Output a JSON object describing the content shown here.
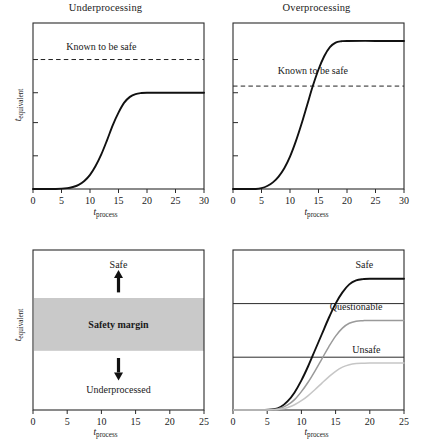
{
  "figure": {
    "axis_labels": {
      "x_var": "t",
      "x_sub": "process",
      "y_var": "t",
      "y_sub": "equivalent"
    }
  },
  "panels": [
    {
      "id": "underprocessing",
      "title": "Underprocessing",
      "x_ticks": [
        "0",
        "5",
        "10",
        "15",
        "20",
        "25",
        "30"
      ],
      "annotations": [
        {
          "name": "known-to-be-safe-label",
          "text": "Known to be safe"
        }
      ]
    },
    {
      "id": "overprocessing",
      "title": "Overprocessing",
      "x_ticks": [
        "0",
        "5",
        "10",
        "15",
        "20",
        "25",
        "30"
      ],
      "annotations": [
        {
          "name": "known-to-be-safe-label",
          "text": "Known to be safe"
        }
      ]
    },
    {
      "id": "safety-margin",
      "title": "",
      "x_ticks": [
        "0",
        "5",
        "10",
        "15",
        "20",
        "25"
      ],
      "annotations": [
        {
          "name": "safe-label",
          "text": "Safe"
        },
        {
          "name": "safety-margin-label",
          "text": "Safety margin"
        },
        {
          "name": "underprocessed-label",
          "text": "Underprocessed"
        }
      ]
    },
    {
      "id": "outcome-curves",
      "title": "",
      "x_ticks": [
        "0",
        "5",
        "10",
        "15",
        "20",
        "25"
      ],
      "annotations": [
        {
          "name": "safe-curve-label",
          "text": "Safe"
        },
        {
          "name": "questionable-curve-label",
          "text": "Questionable"
        },
        {
          "name": "unsafe-curve-label",
          "text": "Unsafe"
        }
      ]
    }
  ],
  "colors": {
    "axis": "#2b2b2b",
    "curve_safe": "#111111",
    "curve_questionable": "#9a9a9a",
    "curve_unsafe": "#c6c6c6",
    "safety_band": "#c9c9c9",
    "text": "#1a1a1a"
  },
  "chart_data": [
    {
      "type": "line",
      "id": "underprocessing",
      "title": "Underprocessing",
      "xlabel": "t_process",
      "ylabel": "t_equivalent",
      "xlim": [
        0,
        30
      ],
      "ylim": [
        0,
        1
      ],
      "xticks": [
        0,
        5,
        10,
        15,
        20,
        25,
        30
      ],
      "grid": false,
      "legend": "none",
      "series": [
        {
          "name": "equivalent time",
          "color": "#111111",
          "x": [
            0,
            2,
            4,
            6,
            7,
            8,
            9,
            10,
            11,
            12,
            13,
            14,
            15,
            16,
            17,
            18,
            19,
            20,
            22,
            25,
            30
          ],
          "y": [
            0.0,
            0.0,
            0.0,
            0.005,
            0.012,
            0.025,
            0.048,
            0.085,
            0.14,
            0.21,
            0.295,
            0.385,
            0.46,
            0.52,
            0.555,
            0.572,
            0.578,
            0.58,
            0.58,
            0.58,
            0.58
          ]
        }
      ],
      "reference_lines": [
        {
          "name": "Known to be safe",
          "type": "horizontal",
          "y": 0.78,
          "style": "dashed"
        }
      ],
      "annotations": [
        {
          "text": "Known to be safe",
          "x": 12,
          "y": 0.84
        }
      ]
    },
    {
      "type": "line",
      "id": "overprocessing",
      "title": "Overprocessing",
      "xlabel": "t_process",
      "ylabel": "t_equivalent",
      "xlim": [
        0,
        30
      ],
      "ylim": [
        0,
        1
      ],
      "xticks": [
        0,
        5,
        10,
        15,
        20,
        25,
        30
      ],
      "grid": false,
      "legend": "none",
      "series": [
        {
          "name": "equivalent time",
          "color": "#111111",
          "x": [
            0,
            2,
            4,
            5,
            6,
            7,
            8,
            9,
            10,
            11,
            12,
            13,
            14,
            15,
            16,
            17,
            18,
            19,
            20,
            25,
            30
          ],
          "y": [
            0.0,
            0.0,
            0.0,
            0.005,
            0.018,
            0.04,
            0.075,
            0.125,
            0.195,
            0.285,
            0.39,
            0.505,
            0.62,
            0.72,
            0.8,
            0.855,
            0.882,
            0.89,
            0.892,
            0.892,
            0.892
          ]
        }
      ],
      "reference_lines": [
        {
          "name": "Known to be safe",
          "type": "horizontal",
          "y": 0.62,
          "style": "dashed"
        }
      ],
      "annotations": [
        {
          "text": "Known to be safe",
          "x": 14,
          "y": 0.69
        }
      ]
    },
    {
      "type": "area",
      "id": "safety-margin",
      "title": "",
      "xlabel": "t_process",
      "ylabel": "t_equivalent",
      "xlim": [
        0,
        25
      ],
      "ylim": [
        0,
        1
      ],
      "xticks": [
        0,
        5,
        10,
        15,
        20,
        25
      ],
      "grid": false,
      "legend": "none",
      "bands": [
        {
          "name": "Safety margin",
          "y_low": 0.37,
          "y_high": 0.7,
          "color": "#c9c9c9"
        }
      ],
      "annotations": [
        {
          "text": "Safe",
          "x": 12.5,
          "y": 0.87,
          "arrow": "up"
        },
        {
          "text": "Safety margin",
          "x": 12.5,
          "y": 0.535
        },
        {
          "text": "Underprocessed",
          "x": 12.5,
          "y": 0.12,
          "arrow": "down"
        }
      ]
    },
    {
      "type": "line",
      "id": "outcome-curves",
      "title": "",
      "xlabel": "t_process",
      "ylabel": "t_equivalent",
      "xlim": [
        0,
        25
      ],
      "ylim": [
        0,
        1
      ],
      "xticks": [
        0,
        5,
        10,
        15,
        20,
        25
      ],
      "grid": false,
      "legend": "inline",
      "series": [
        {
          "name": "Safe",
          "color": "#111111",
          "x": [
            0,
            4,
            6,
            7,
            8,
            9,
            10,
            11,
            12,
            13,
            14,
            15,
            16,
            17,
            18,
            19,
            20,
            25
          ],
          "y": [
            0.0,
            0.0,
            0.005,
            0.02,
            0.055,
            0.11,
            0.185,
            0.275,
            0.375,
            0.475,
            0.575,
            0.665,
            0.735,
            0.785,
            0.81,
            0.818,
            0.82,
            0.82
          ]
        },
        {
          "name": "Questionable",
          "color": "#9a9a9a",
          "x": [
            0,
            4,
            6,
            7,
            8,
            9,
            10,
            11,
            12,
            13,
            14,
            15,
            16,
            17,
            18,
            19,
            20,
            25
          ],
          "y": [
            0.0,
            0.0,
            0.003,
            0.012,
            0.032,
            0.065,
            0.115,
            0.175,
            0.245,
            0.32,
            0.395,
            0.462,
            0.512,
            0.542,
            0.555,
            0.558,
            0.56,
            0.56
          ]
        },
        {
          "name": "Unsafe",
          "color": "#c6c6c6",
          "x": [
            0,
            4,
            6,
            7,
            8,
            9,
            10,
            11,
            12,
            13,
            14,
            15,
            16,
            17,
            18,
            19,
            20,
            25
          ],
          "y": [
            0.0,
            0.0,
            0.002,
            0.006,
            0.016,
            0.033,
            0.058,
            0.09,
            0.128,
            0.168,
            0.207,
            0.242,
            0.268,
            0.283,
            0.29,
            0.292,
            0.293,
            0.293
          ]
        }
      ],
      "reference_lines": [
        {
          "name": "safe-threshold",
          "type": "horizontal",
          "y": 0.665,
          "style": "solid"
        },
        {
          "name": "questionable-threshold",
          "type": "horizontal",
          "y": 0.33,
          "style": "solid"
        }
      ]
    }
  ]
}
